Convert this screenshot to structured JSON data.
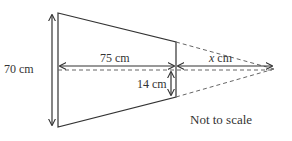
{
  "diagram": {
    "labels": {
      "height_left": "70 cm",
      "length": "75 cm",
      "x_var": "x",
      "x_unit": " cm",
      "height_right": "14 cm",
      "note": "Not to scale"
    },
    "colors": {
      "stroke": "#333333",
      "dashed": "#666666",
      "background": "#ffffff"
    }
  }
}
